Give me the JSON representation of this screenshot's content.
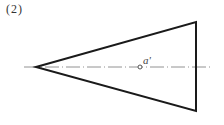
{
  "figure": {
    "number_label": "(2)",
    "point_label": "a'",
    "shape": "triangle",
    "vertices": {
      "apex_left": [
        36,
        67
      ],
      "top_right": [
        196,
        22
      ],
      "bottom_right": [
        196,
        111
      ]
    },
    "centerline": {
      "x1": 24,
      "x2": 212,
      "y": 67,
      "style": "dash-dot"
    },
    "point": {
      "x": 140,
      "y": 67,
      "marker": "open-circle"
    },
    "colors": {
      "outline": "#1a1a1a",
      "centerline": "#777777",
      "text": "#333333"
    }
  }
}
